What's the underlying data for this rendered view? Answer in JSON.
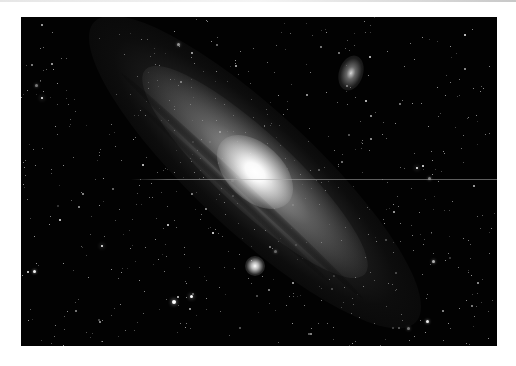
{
  "image": {
    "subject": "Andromeda Galaxy (M31) astrophotograph",
    "description": "Large spiral galaxy seen at a steep angle, running diagonally from upper-left to lower-right, with bright white core, dark dust lanes, and two satellite galaxies (M110 upper-right, M32 lower-center) over a dense star field on black background, framed by white margins.",
    "frame": {
      "left": 21,
      "top": 17,
      "width": 476,
      "height": 329
    },
    "colors": {
      "page_background": "#ffffff",
      "sky": "#020202",
      "core": "#ffffff",
      "disk": "#9a9a9a",
      "scan_line": "#aaaaaa"
    },
    "features": {
      "core_center": [
        255,
        172
      ],
      "companion_m110_center": [
        353,
        74
      ],
      "companion_m32_center": [
        255,
        266
      ],
      "scan_line_y": 179
    }
  }
}
